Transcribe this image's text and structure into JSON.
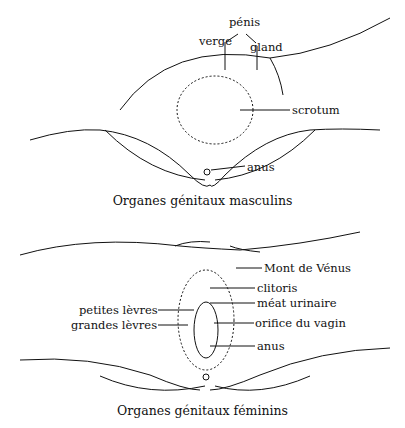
{
  "figures": [
    {
      "id": "male",
      "caption": "Organes génitaux masculins",
      "labels": {
        "penis": "pénis",
        "shaft": "verge",
        "glans": "gland",
        "scrotum": "scrotum",
        "anus": "anus"
      }
    },
    {
      "id": "female",
      "caption": "Organes génitaux féminins",
      "labels": {
        "mons": "Mont de Vénus",
        "clitoris": "clitoris",
        "urethral_opening": "méat urinaire",
        "vaginal_opening": "orifice du vagin",
        "labia_minora": "petites lèvres",
        "labia_majora": "grandes lèvres",
        "anus": "anus"
      }
    }
  ],
  "colors": {
    "ink": "#111111",
    "background": "#ffffff"
  }
}
